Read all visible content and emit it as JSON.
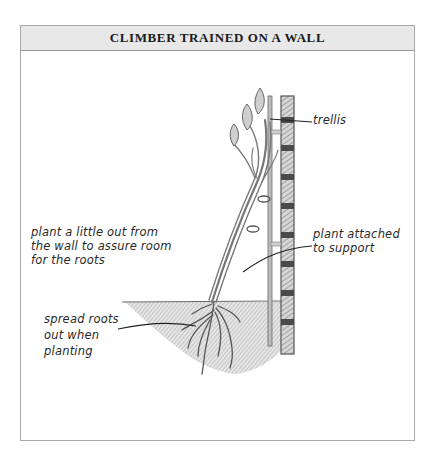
{
  "figure": {
    "title": "CLIMBER TRAINED ON A WALL"
  },
  "labels": {
    "trellis": [
      "trellis"
    ],
    "plant_out": [
      "plant a little out from",
      "the wall to assure room",
      "for the roots"
    ],
    "attached": [
      "plant attached",
      "to support"
    ],
    "spread_roots": [
      "spread roots",
      "out when",
      "planting"
    ]
  },
  "colors": {
    "frame": "#a9a9a9",
    "header_bg": "#e8e8e8",
    "ink": "#2a2a2a",
    "soil_shade": "#9a9a9a",
    "brick_dark": "#4a4a4a"
  }
}
